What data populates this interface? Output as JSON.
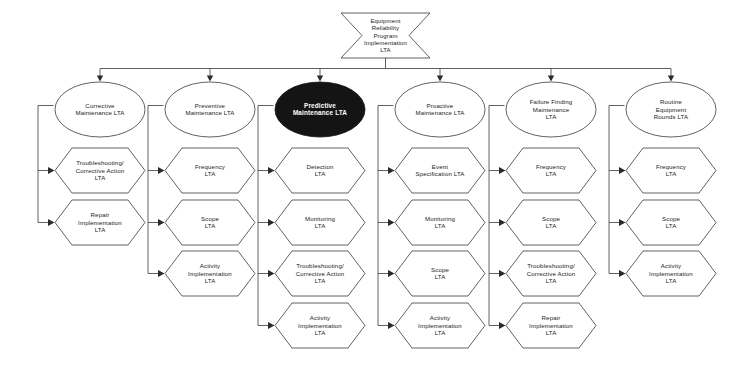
{
  "diagram": {
    "type": "fault-tree",
    "colors": {
      "background": "#ffffff",
      "outline": "#3a3a3a",
      "text": "#1a1a1a",
      "highlight_fill": "#141414",
      "highlight_text": "#ffffff"
    },
    "root": {
      "id": "root",
      "shape": "inward-arrow-hexagon",
      "lines": [
        "Equipment",
        "Reliability",
        "Program",
        "Implementation",
        "LTA"
      ],
      "highlighted": false
    },
    "branches": [
      {
        "id": "corrective-maintenance",
        "shape": "ellipse",
        "highlighted": false,
        "lines": [
          "Corrective",
          "Maintenance LTA"
        ],
        "children": [
          {
            "id": "corrective-troubleshooting",
            "shape": "hexagon",
            "lines": [
              "Troubleshooting/",
              "Corrective Action",
              "LTA"
            ]
          },
          {
            "id": "corrective-repair",
            "shape": "hexagon",
            "lines": [
              "Repair",
              "Implementation",
              "LTA"
            ]
          }
        ]
      },
      {
        "id": "preventive-maintenance",
        "shape": "ellipse",
        "highlighted": false,
        "lines": [
          "Preventive",
          "Maintenance LTA"
        ],
        "children": [
          {
            "id": "preventive-frequency",
            "shape": "hexagon",
            "lines": [
              "Frequency",
              "LTA"
            ]
          },
          {
            "id": "preventive-scope",
            "shape": "hexagon",
            "lines": [
              "Scope",
              "LTA"
            ]
          },
          {
            "id": "preventive-activity",
            "shape": "hexagon",
            "lines": [
              "Activity",
              "Implementation",
              "LTA"
            ]
          }
        ]
      },
      {
        "id": "predictive-maintenance",
        "shape": "ellipse",
        "highlighted": true,
        "lines": [
          "Predictive",
          "Maintenance LTA"
        ],
        "children": [
          {
            "id": "predictive-detection",
            "shape": "hexagon",
            "lines": [
              "Detection",
              "LTA"
            ]
          },
          {
            "id": "predictive-monitoring",
            "shape": "hexagon",
            "lines": [
              "Monitoring",
              "LTA"
            ]
          },
          {
            "id": "predictive-troubleshooting",
            "shape": "hexagon",
            "lines": [
              "Troubleshooting/",
              "Corrective Action",
              "LTA"
            ]
          },
          {
            "id": "predictive-activity",
            "shape": "hexagon",
            "lines": [
              "Activity",
              "Implementation",
              "LTA"
            ]
          }
        ]
      },
      {
        "id": "proactive-maintenance",
        "shape": "ellipse",
        "highlighted": false,
        "lines": [
          "Proactive",
          "Maintenance LTA"
        ],
        "children": [
          {
            "id": "proactive-event-spec",
            "shape": "hexagon",
            "lines": [
              "Event",
              "Specification LTA"
            ]
          },
          {
            "id": "proactive-monitoring",
            "shape": "hexagon",
            "lines": [
              "Monitoring",
              "LTA"
            ]
          },
          {
            "id": "proactive-scope",
            "shape": "hexagon",
            "lines": [
              "Scope",
              "LTA"
            ]
          },
          {
            "id": "proactive-activity",
            "shape": "hexagon",
            "lines": [
              "Activity",
              "Implementation",
              "LTA"
            ]
          }
        ]
      },
      {
        "id": "failure-finding-maintenance",
        "shape": "ellipse",
        "highlighted": false,
        "lines": [
          "Failure Finding",
          "Maintenance",
          "LTA"
        ],
        "children": [
          {
            "id": "failure-frequency",
            "shape": "hexagon",
            "lines": [
              "Frequency",
              "LTA"
            ]
          },
          {
            "id": "failure-scope",
            "shape": "hexagon",
            "lines": [
              "Scope",
              "LTA"
            ]
          },
          {
            "id": "failure-troubleshooting",
            "shape": "hexagon",
            "lines": [
              "Troubleshooting/",
              "Corrective Action",
              "LTA"
            ]
          },
          {
            "id": "failure-repair",
            "shape": "hexagon",
            "lines": [
              "Repair",
              "Implementation",
              "LTA"
            ]
          }
        ]
      },
      {
        "id": "routine-equipment-rounds",
        "shape": "ellipse",
        "highlighted": false,
        "lines": [
          "Routine",
          "Equipment",
          "Rounds LTA"
        ],
        "children": [
          {
            "id": "routine-frequency",
            "shape": "hexagon",
            "lines": [
              "Frequency",
              "LTA"
            ]
          },
          {
            "id": "routine-scope",
            "shape": "hexagon",
            "lines": [
              "Scope",
              "LTA"
            ]
          },
          {
            "id": "routine-activity",
            "shape": "hexagon",
            "lines": [
              "Activity",
              "Implementation",
              "LTA"
            ]
          }
        ]
      }
    ]
  }
}
